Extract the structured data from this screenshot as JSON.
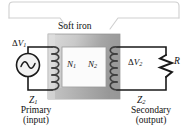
{
  "figure": {
    "type": "transformer-circuit-diagram",
    "width": 191,
    "height": 136,
    "background": "#ffffff"
  },
  "colors": {
    "ink": "#111111",
    "wire": "#1a1a1a",
    "core_fill_light": "#d9d9d9",
    "core_fill_dark": "#9e9e9e",
    "core_window": "#fbfbfb",
    "callout": "#cfcfcf",
    "coil": "#4a4a4a"
  },
  "callout": {
    "bracket_name": "soft-iron-callout-bracket",
    "label": "Soft iron"
  },
  "labels": {
    "soft_iron": "Soft iron",
    "delta_v1_symbol": "Δ",
    "delta_v1_var": "V",
    "delta_v1_sub": "1",
    "delta_v2_symbol": "Δ",
    "delta_v2_var": "V",
    "delta_v2_sub": "2",
    "n1_var": "N",
    "n1_sub": "1",
    "n2_var": "N",
    "n2_sub": "2",
    "resistor": "R",
    "z1_var": "Z",
    "z1_sub": "1",
    "z2_var": "Z",
    "z2_sub": "2"
  },
  "captions": {
    "primary_line1": "Primary",
    "primary_line2": "(input)",
    "secondary_line1": "Secondary",
    "secondary_line2": "(output)"
  },
  "components": {
    "ac_source": "ac-source-symbol",
    "primary_coil": "primary-winding-coil",
    "secondary_coil": "secondary-winding-coil",
    "core": "soft-iron-core",
    "load_resistor": "load-resistor-zigzag"
  }
}
